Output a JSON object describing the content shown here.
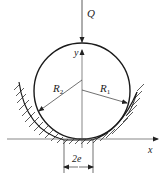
{
  "diagram": {
    "labels": {
      "load": "Q",
      "y_axis": "y",
      "x_axis": "x",
      "outer_radius": "R",
      "outer_radius_sub": "2",
      "inner_radius": "R",
      "inner_radius_sub": "1",
      "contact_width": "2e"
    },
    "colors": {
      "line": "#1a1a1a",
      "axis": "#444444",
      "background": "#ffffff"
    }
  }
}
